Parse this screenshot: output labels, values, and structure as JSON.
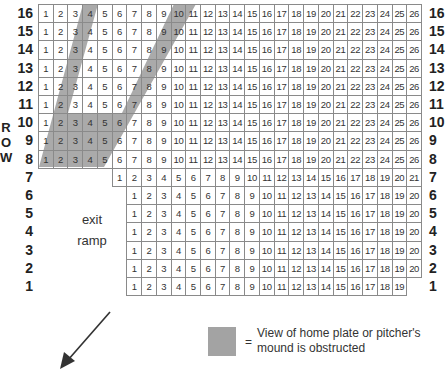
{
  "diagram": {
    "type": "stadium-seating-chart",
    "axis_label": "ROW",
    "axis_label_letters": [
      "R",
      "O",
      "W"
    ],
    "rows": [
      {
        "row": "16",
        "seats": 26,
        "start_col": 0
      },
      {
        "row": "15",
        "seats": 26,
        "start_col": 0
      },
      {
        "row": "14",
        "seats": 26,
        "start_col": 0
      },
      {
        "row": "13",
        "seats": 26,
        "start_col": 0
      },
      {
        "row": "12",
        "seats": 26,
        "start_col": 0
      },
      {
        "row": "11",
        "seats": 26,
        "start_col": 0
      },
      {
        "row": "10",
        "seats": 26,
        "start_col": 0
      },
      {
        "row": "9",
        "seats": 26,
        "start_col": 0
      },
      {
        "row": "8",
        "seats": 26,
        "start_col": 0
      },
      {
        "row": "7",
        "seats": 21,
        "start_col": 5
      },
      {
        "row": "6",
        "seats": 20,
        "start_col": 6
      },
      {
        "row": "5",
        "seats": 20,
        "start_col": 6
      },
      {
        "row": "4",
        "seats": 20,
        "start_col": 6
      },
      {
        "row": "3",
        "seats": 20,
        "start_col": 6
      },
      {
        "row": "2",
        "seats": 20,
        "start_col": 6
      },
      {
        "row": "1",
        "seats": 19,
        "start_col": 6
      }
    ],
    "exit_label_line1": "exit",
    "exit_label_line2": "ramp",
    "obstructed_region": "V-shaped shaded area covering seats roughly 1–11 in rows 8–16",
    "legend": {
      "symbol": "=",
      "text": "View of home plate or pitcher's mound is obstructed",
      "swatch_color": "#a3a3a3"
    },
    "arrow_direction": "down-left",
    "colors": {
      "grid_line": "#8a8a8a",
      "shade": "#a3a3a3",
      "text": "#222222"
    }
  }
}
